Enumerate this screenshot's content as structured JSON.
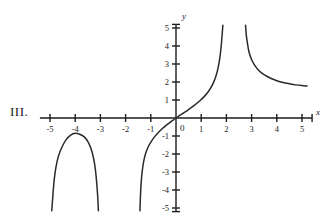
{
  "figure": {
    "label": "III."
  },
  "chart_data": {
    "type": "line",
    "title": "",
    "subtitle": "",
    "xlabel": "x",
    "ylabel": "y",
    "grid": false,
    "legend": "none",
    "xlim": [
      -5.4,
      5.4
    ],
    "ylim": [
      -5.2,
      5.2
    ],
    "xticks": [
      -5,
      -4,
      -3,
      -2,
      -1,
      1,
      2,
      3,
      4,
      5
    ],
    "yticks": [
      5,
      4,
      3,
      2,
      1,
      -1,
      -2,
      -3,
      -4,
      -5
    ],
    "xtick_labels": [
      "-5",
      "-4",
      "-3",
      "-2",
      "-1",
      "1",
      "2",
      "3",
      "4",
      "5"
    ],
    "ytick_labels": [
      "5",
      "4",
      "3",
      "2",
      "1",
      "-1",
      "-2",
      "-3",
      "-4",
      "-5"
    ],
    "origin_label": "0",
    "vertical_asymptotes": [
      -4.85,
      -3.15,
      -1.4,
      1.85,
      2.8
    ],
    "series": [
      {
        "name": "branch-left",
        "comment": "inverted hump between asymptotes near x=-4.85 and x=-3.15, peak about (-4, -0.8)",
        "points": [
          [
            -4.93,
            -5.15
          ],
          [
            -4.88,
            -4.2
          ],
          [
            -4.83,
            -3.4
          ],
          [
            -4.76,
            -2.7
          ],
          [
            -4.66,
            -2.1
          ],
          [
            -4.52,
            -1.6
          ],
          [
            -4.36,
            -1.2
          ],
          [
            -4.18,
            -0.95
          ],
          [
            -4.0,
            -0.85
          ],
          [
            -3.82,
            -0.9
          ],
          [
            -3.64,
            -1.05
          ],
          [
            -3.48,
            -1.35
          ],
          [
            -3.36,
            -1.75
          ],
          [
            -3.27,
            -2.25
          ],
          [
            -3.2,
            -2.85
          ],
          [
            -3.15,
            -3.55
          ],
          [
            -3.11,
            -4.3
          ],
          [
            -3.08,
            -5.15
          ]
        ]
      },
      {
        "name": "branch-middle",
        "comment": "rises through the origin from a vertical asymptote near x=-1.4",
        "points": [
          [
            -1.43,
            -5.15
          ],
          [
            -1.41,
            -4.3
          ],
          [
            -1.38,
            -3.55
          ],
          [
            -1.34,
            -2.95
          ],
          [
            -1.28,
            -2.4
          ],
          [
            -1.2,
            -1.95
          ],
          [
            -1.1,
            -1.6
          ],
          [
            -0.98,
            -1.3
          ],
          [
            -0.84,
            -1.02
          ],
          [
            -0.7,
            -0.8
          ],
          [
            -0.55,
            -0.6
          ],
          [
            -0.4,
            -0.42
          ],
          [
            -0.25,
            -0.26
          ],
          [
            -0.1,
            -0.1
          ],
          [
            0,
            0
          ],
          [
            0.15,
            0.14
          ],
          [
            0.3,
            0.28
          ],
          [
            0.5,
            0.47
          ],
          [
            0.7,
            0.67
          ],
          [
            0.9,
            0.9
          ],
          [
            1.1,
            1.16
          ],
          [
            1.3,
            1.5
          ],
          [
            1.45,
            1.85
          ],
          [
            1.58,
            2.3
          ],
          [
            1.68,
            2.85
          ],
          [
            1.75,
            3.45
          ],
          [
            1.8,
            4.1
          ],
          [
            1.84,
            4.8
          ],
          [
            1.86,
            5.15
          ]
        ]
      },
      {
        "name": "branch-right",
        "comment": "falls from the asymptote near x=2.8 and flattens toward y just under 2 at x=5",
        "points": [
          [
            2.76,
            5.15
          ],
          [
            2.79,
            4.6
          ],
          [
            2.84,
            4.1
          ],
          [
            2.9,
            3.65
          ],
          [
            2.99,
            3.28
          ],
          [
            3.1,
            2.98
          ],
          [
            3.25,
            2.7
          ],
          [
            3.42,
            2.48
          ],
          [
            3.6,
            2.32
          ],
          [
            3.8,
            2.18
          ],
          [
            4.0,
            2.07
          ],
          [
            4.25,
            1.97
          ],
          [
            4.5,
            1.9
          ],
          [
            4.75,
            1.84
          ],
          [
            5.0,
            1.8
          ],
          [
            5.2,
            1.78
          ]
        ]
      }
    ]
  }
}
